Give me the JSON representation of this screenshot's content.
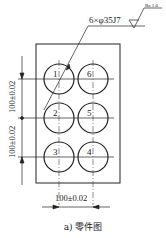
{
  "figure": {
    "caption": "a) 零件图",
    "annotation": {
      "hole_spec": "6×φ35J7",
      "roughness": "Ra 1.6"
    },
    "dimensions": {
      "horizontal": "100±0.02",
      "vertical_upper": "100±0.02",
      "vertical_lower": "100±0.02"
    },
    "holes": [
      {
        "label": "1"
      },
      {
        "label": "2"
      },
      {
        "label": "3"
      },
      {
        "label": "4"
      },
      {
        "label": "5"
      },
      {
        "label": "6"
      }
    ],
    "colors": {
      "line": "#222222",
      "background": "#ffffff"
    }
  }
}
